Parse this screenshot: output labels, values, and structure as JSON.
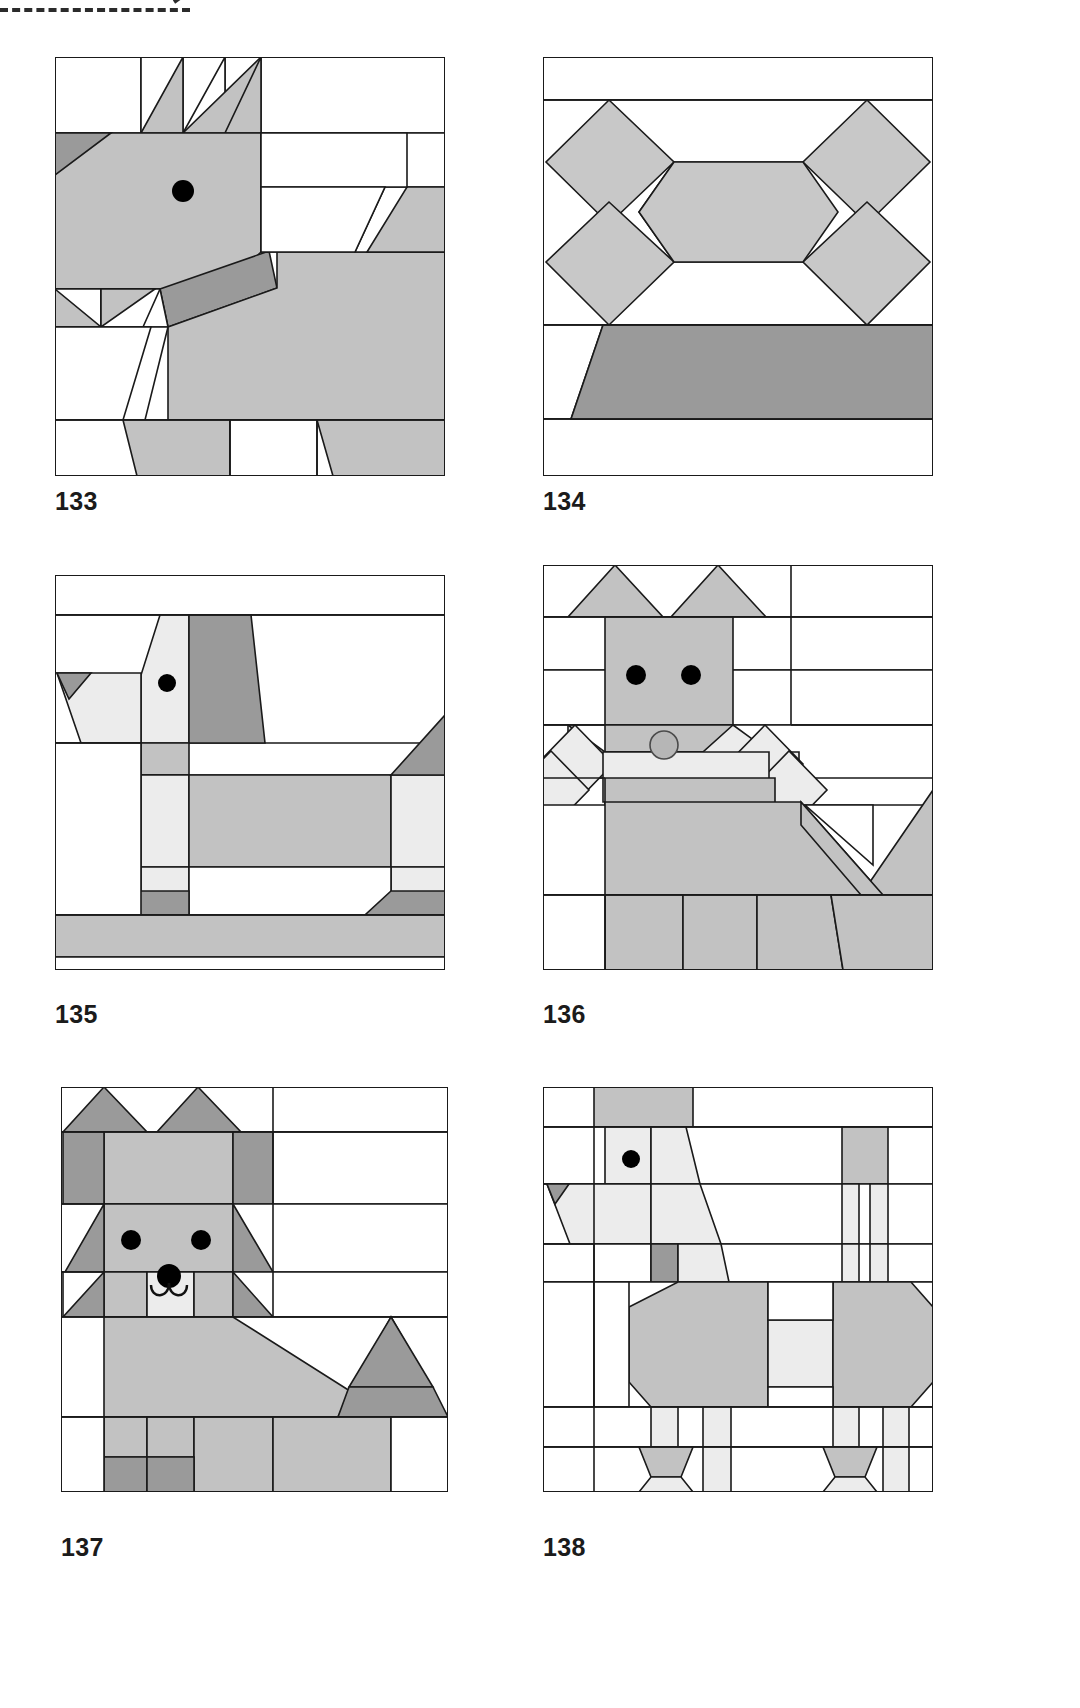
{
  "page": {
    "background_color": "#ffffff",
    "decoration": {
      "name": "dashed-cut-line",
      "color": "#2b2b2b",
      "style": "dashed"
    }
  },
  "palette": {
    "outline": "#1a1a1a",
    "white": "#ffffff",
    "light": "#e8e8e8",
    "medium_light": "#d2d2d2",
    "medium": "#c2c2c2",
    "mid_gray": "#bdbdbd",
    "dark": "#9a9a9a",
    "eye_black": "#000000"
  },
  "blocks": [
    {
      "id": "block-133",
      "caption": "133",
      "subject": "dog facing left with pointed ears and collar",
      "row": 1,
      "column": 1,
      "features": [
        "two ears",
        "one eye",
        "dark collar",
        "body",
        "legs",
        "tail"
      ]
    },
    {
      "id": "block-134",
      "caption": "134",
      "subject": "dog bone with dark base bar",
      "row": 1,
      "column": 2,
      "features": [
        "four knob squares",
        "center bar",
        "dark trapezoid bowl"
      ]
    },
    {
      "id": "block-135",
      "caption": "135",
      "subject": "standing dog in profile with long muzzle",
      "row": 2,
      "column": 1,
      "features": [
        "muzzle",
        "one eye",
        "dark ear",
        "body",
        "legs",
        "tail",
        "ground bar"
      ]
    },
    {
      "id": "block-136",
      "caption": "136",
      "subject": "front-facing dog with triangle ears and diamond paws",
      "row": 2,
      "column": 2,
      "features": [
        "two triangle ears",
        "two eyes",
        "round nose",
        "muzzle bar",
        "two diamond paws",
        "body",
        "tail",
        "four legs"
      ]
    },
    {
      "id": "block-137",
      "caption": "137",
      "subject": "sitting dog with fluffy ruff and upright tail",
      "row": 3,
      "column": 1,
      "features": [
        "two ears",
        "two eyes",
        "nose and mouth",
        "ruff triangles",
        "body",
        "tail",
        "feet"
      ]
    },
    {
      "id": "block-138",
      "caption": "138",
      "subject": "poodle with topknot, octagon body and pompom legs",
      "row": 3,
      "column": 2,
      "features": [
        "topknot",
        "one eye",
        "muzzle",
        "octagon body",
        "octagon hindquarters",
        "four legs with cuffs",
        "tail"
      ]
    }
  ]
}
